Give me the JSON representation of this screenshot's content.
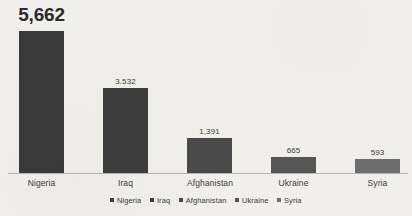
{
  "chart_data": {
    "type": "bar",
    "title": "",
    "subtitle": "",
    "xlabel": "",
    "ylabel": "",
    "grid": false,
    "legend_position": "bottom-center",
    "ylim": [
      0,
      5662
    ],
    "categories": [
      "Nigeria",
      "Iraq",
      "Afghanistan",
      "Ukraine",
      "Syria"
    ],
    "values": [
      5662,
      3532,
      1391,
      665,
      593
    ],
    "value_labels": [
      "5,662",
      "3.532",
      "1,391",
      "665",
      "593"
    ],
    "bar_colors": [
      "#3a3a3a",
      "#3e3e3e",
      "#4a4a4a",
      "#565656",
      "#6e6e6e"
    ],
    "legend": [
      {
        "label": "Nigeria",
        "color": "#3a3a3a"
      },
      {
        "label": "Iraq",
        "color": "#3e3e3e"
      },
      {
        "label": "Afghanistan",
        "color": "#4a4a4a"
      },
      {
        "label": "Ukraine",
        "color": "#565656"
      },
      {
        "label": "Syria",
        "color": "#6e6e6e"
      }
    ],
    "bars": [
      {
        "category": "Nigeria",
        "value": 5662,
        "value_label": "5,662",
        "color": "#3a3a3a",
        "featured": true,
        "left": 19,
        "width": 45,
        "height": 142
      },
      {
        "category": "Iraq",
        "value": 3532,
        "value_label": "3.532",
        "color": "#3e3e3e",
        "featured": false,
        "left": 103,
        "width": 45,
        "height": 85
      },
      {
        "category": "Afghanistan",
        "value": 1391,
        "value_label": "1,391",
        "color": "#4a4a4a",
        "featured": false,
        "left": 187,
        "width": 45,
        "height": 35
      },
      {
        "category": "Ukraine",
        "value": 665,
        "value_label": "665",
        "color": "#565656",
        "featured": false,
        "left": 271,
        "width": 45,
        "height": 16
      },
      {
        "category": "Syria",
        "value": 593,
        "value_label": "593",
        "color": "#6e6e6e",
        "featured": false,
        "left": 355,
        "width": 45,
        "height": 14
      }
    ],
    "axis": {
      "baseline_color": "#b9b5ae"
    },
    "background_color": "#f2f0ec"
  }
}
